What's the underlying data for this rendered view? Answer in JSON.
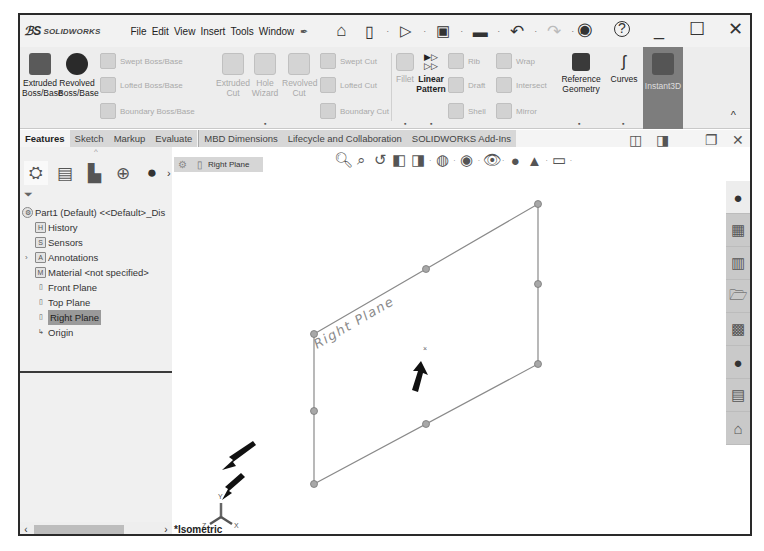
{
  "app": {
    "logo_prefix": "ℬS",
    "logo_text": "SOLIDWORKS",
    "menu": [
      "File",
      "Edit",
      "View",
      "Insert",
      "Tools",
      "Window"
    ],
    "pin_icon": "pin-icon",
    "search_prefix": "P_"
  },
  "quick_access": [
    {
      "name": "home-icon",
      "glyph": "⌂"
    },
    {
      "name": "new-document-icon",
      "glyph": "🗋"
    },
    {
      "name": "open-icon",
      "glyph": "📂"
    },
    {
      "name": "save-icon",
      "glyph": "💾"
    },
    {
      "name": "print-icon",
      "glyph": "🖶"
    },
    {
      "name": "undo-icon",
      "glyph": "↶"
    },
    {
      "name": "redo-icon",
      "glyph": "↷"
    }
  ],
  "window_controls": {
    "user": "◉",
    "help": "?",
    "minimize": "_",
    "maximize": "☐",
    "close": "✕"
  },
  "ribbon": {
    "extruded_boss": [
      "Extruded",
      "Boss/Base"
    ],
    "revolved_boss": [
      "Revolved",
      "Boss/Base"
    ],
    "swept_boss": "Swept Boss/Base",
    "lofted_boss": "Lofted Boss/Base",
    "boundary_boss": "Boundary Boss/Base",
    "extruded_cut": [
      "Extruded",
      "Cut"
    ],
    "hole_wizard": [
      "Hole",
      "Wizard"
    ],
    "revolved_cut": [
      "Revolved",
      "Cut"
    ],
    "swept_cut": "Swept Cut",
    "lofted_cut": "Lofted Cut",
    "boundary_cut": "Boundary Cut",
    "fillet": "Fillet",
    "linear_pattern": [
      "Linear",
      "Pattern"
    ],
    "rib": "Rib",
    "wrap": "Wrap",
    "draft": "Draft",
    "intersect": "Intersect",
    "shell": "Shell",
    "mirror": "Mirror",
    "reference_geometry": [
      "Reference",
      "Geometry"
    ],
    "curves": "Curves",
    "instant3d": "Instant3D"
  },
  "tabs": [
    {
      "label": "Features",
      "active": true
    },
    {
      "label": "Sketch"
    },
    {
      "label": "Markup"
    },
    {
      "label": "Evaluate"
    },
    {
      "label": "MBD Dimensions"
    },
    {
      "label": "Lifecycle and Collaboration"
    },
    {
      "label": "SOLIDWORKS Add-Ins"
    }
  ],
  "feature_manager": {
    "tabs": [
      "featuremanager-icon",
      "propertymanager-icon",
      "configurationmanager-icon",
      "dimxpert-icon",
      "display-manager-icon"
    ],
    "root": "Part1 (Default) <<Default>_Dis",
    "items": [
      {
        "label": "History",
        "icon": "H"
      },
      {
        "label": "Sensors",
        "icon": "S"
      },
      {
        "label": "Annotations",
        "icon": "A",
        "expandable": true
      },
      {
        "label": "Material <not specified>",
        "icon": "M"
      },
      {
        "label": "Front Plane",
        "icon": "▯"
      },
      {
        "label": "Top Plane",
        "icon": "▯"
      },
      {
        "label": "Right Plane",
        "icon": "▯",
        "selected": true
      },
      {
        "label": "Origin",
        "icon": "↳"
      }
    ]
  },
  "graphics": {
    "breadcrumb": "Right Plane",
    "plane_label": "Right Plane",
    "view_orientation": "*Isometric",
    "triad": {
      "x": "X",
      "y": "Y",
      "z": "Z"
    }
  },
  "task_pane": [
    "solidworks-resources-icon",
    "design-library-icon",
    "file-explorer-icon",
    "view-palette-icon",
    "folder-icon",
    "appearances-icon",
    "custom-properties-icon",
    "home-3dexperience-icon"
  ]
}
